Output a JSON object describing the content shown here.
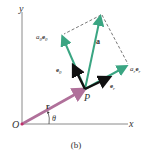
{
  "figure": {
    "caption": "(b)",
    "colors": {
      "axis": "#8a8a8a",
      "position_vector": "#b0709a",
      "acceleration": "#3aa582",
      "unit_vectors": "#111111",
      "dashed": "#555555"
    }
  },
  "axes": {
    "x_label": "x",
    "y_label": "y",
    "origin_label": "O"
  },
  "vectors": {
    "r": {
      "label": "r",
      "from": [
        22,
        124
      ],
      "to": [
        85,
        89
      ]
    },
    "a": {
      "label": "a",
      "from": [
        85,
        89
      ],
      "to": [
        101,
        15
      ]
    },
    "a_theta": {
      "label_a": "a",
      "label_sub": "θ",
      "label_e": "e",
      "label_esub": "θ",
      "from": [
        85,
        89
      ],
      "to": [
        62,
        35
      ]
    },
    "a_r": {
      "label_a": "a",
      "label_sub": "r",
      "label_e": "e",
      "label_esub": "r",
      "from": [
        85,
        89
      ],
      "to": [
        128,
        66
      ]
    },
    "e_theta": {
      "label": "e",
      "sub": "θ",
      "from": [
        85,
        89
      ],
      "to": [
        73,
        65
      ]
    },
    "e_r": {
      "label": "e",
      "sub": "r",
      "from": [
        85,
        89
      ],
      "to": [
        110,
        77
      ]
    }
  },
  "points": {
    "P": {
      "label": "P"
    }
  },
  "angle": {
    "label": "θ"
  }
}
